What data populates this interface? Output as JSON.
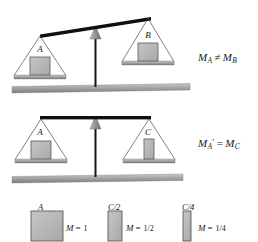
{
  "figure": {
    "balances": [
      {
        "id": "balance-tilted",
        "state": "unbalanced",
        "left_block_label": "A",
        "right_block_label": "B",
        "equation": {
          "left_symbol": "M",
          "left_subscript": "A",
          "operator": "≠",
          "right_symbol": "M",
          "right_subscript": "B"
        }
      },
      {
        "id": "balance-level",
        "state": "balanced",
        "left_block_label": "A",
        "right_block_label": "C",
        "equation": {
          "left_symbol": "M",
          "left_subscript": "A",
          "left_prime": "′",
          "operator": "=",
          "right_symbol": "M",
          "right_subscript": "C"
        }
      }
    ],
    "colors": {
      "beam": "#111111",
      "block_fill": "#b3b3b3",
      "block_stroke": "#4d4d4d",
      "ground_bar": "#9a9a9a",
      "pan_bar": "#8f8f8f",
      "fulcrum": "#999999",
      "string": "#555555"
    }
  },
  "legend": {
    "items": [
      {
        "caption": "A",
        "mass_symbol": "M",
        "equals": "=",
        "mass_value": "1",
        "relative_width": "full"
      },
      {
        "caption": "C/2",
        "mass_symbol": "M",
        "equals": "=",
        "mass_value": "1/2",
        "relative_width": "half"
      },
      {
        "caption": "C/4",
        "mass_symbol": "M",
        "equals": "=",
        "mass_value": "1/4",
        "relative_width": "quarter"
      }
    ]
  }
}
